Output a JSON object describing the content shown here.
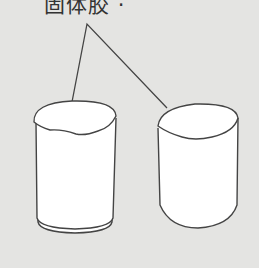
{
  "label": {
    "text": "固体胶 ·"
  },
  "colors": {
    "background": "#e4e4e2",
    "stroke": "#444444",
    "fill": "#ffffff"
  },
  "objects": [
    {
      "name": "left-cylinder",
      "has_base_rim": true
    },
    {
      "name": "right-cylinder",
      "has_base_rim": false
    }
  ]
}
